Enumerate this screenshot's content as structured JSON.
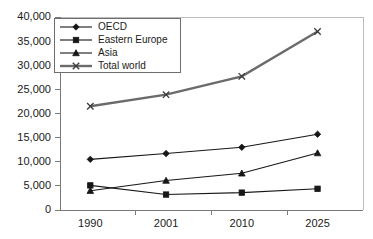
{
  "chart_data": {
    "type": "line",
    "title": "",
    "subtitle": "",
    "xlabel": "",
    "ylabel": "",
    "categories": [
      "1990",
      "2001",
      "2010",
      "2025"
    ],
    "x": [
      "1990",
      "2001",
      "2010",
      "2025"
    ],
    "ylim": [
      0,
      40000
    ],
    "ytick_values": [
      0,
      5000,
      10000,
      15000,
      20000,
      25000,
      30000,
      35000,
      40000
    ],
    "ytick_labels": [
      "0",
      "5,000",
      "10,000",
      "15,000",
      "20,000",
      "25,000",
      "30,000",
      "35,000",
      "40,000"
    ],
    "xtick_labels": [
      "1990",
      "2001",
      "2010",
      "2025"
    ],
    "grid": false,
    "legend_position": "top-left-inside",
    "series": [
      {
        "name": "OECD",
        "marker": "diamond",
        "color": "#171717",
        "line_weight": "thin",
        "values": [
          10500,
          11700,
          13000,
          15700
        ]
      },
      {
        "name": "Eastern Europe",
        "marker": "square",
        "color": "#171717",
        "line_weight": "thin",
        "values": [
          5100,
          3200,
          3600,
          4400
        ]
      },
      {
        "name": "Asia",
        "marker": "triangle",
        "color": "#171717",
        "line_weight": "thin",
        "values": [
          4000,
          6100,
          7600,
          11800
        ]
      },
      {
        "name": "Total world",
        "marker": "cross",
        "color": "#6b6b6b",
        "line_weight": "thick",
        "values": [
          21500,
          23900,
          27700,
          37000
        ]
      }
    ]
  },
  "legend": {
    "items": [
      {
        "label": "OECD",
        "marker": "diamond-marker-icon"
      },
      {
        "label": "Eastern Europe",
        "marker": "square-marker-icon"
      },
      {
        "label": "Asia",
        "marker": "triangle-marker-icon"
      },
      {
        "label": "Total world",
        "marker": "cross-marker-icon"
      }
    ]
  },
  "colors": {
    "plot_background": "#ffffff",
    "axis": "#7a7a7a",
    "frame": "#bdbdbd",
    "series_dark": "#171717",
    "series_gray": "#6b6b6b",
    "text": "#1a1a1a"
  }
}
